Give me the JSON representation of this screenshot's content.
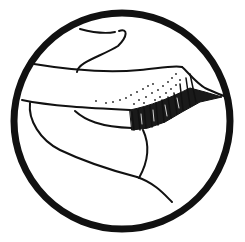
{
  "illustration": {
    "subject": "eyelid with eyelashes line drawing in circular frame",
    "background_color": "#ffffff",
    "ink_color": "#111111",
    "frame": {
      "shape": "circle",
      "cx": 122,
      "cy": 121,
      "r": 108,
      "stroke_width": 7
    }
  }
}
